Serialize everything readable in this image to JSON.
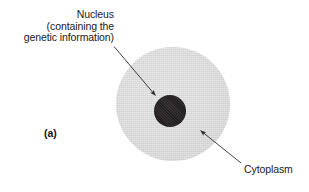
{
  "figure": {
    "panel_letter": "(a)",
    "diagram_type": "animal-cell-schematic",
    "colors": {
      "cytoplasm_fill": "#dedede",
      "nucleus_fill": "#231f20",
      "leader_line": "#2b2b2b",
      "background": "#ffffff",
      "text": "#1a1a1a"
    },
    "labels": {
      "nucleus": {
        "line1": "Nucleus",
        "line2": "(containing the",
        "line3": "genetic information)"
      },
      "cytoplasm": "Cytoplasm"
    },
    "parts": [
      {
        "name": "nucleus",
        "label": "Nucleus (containing the genetic information)",
        "shape": "circle",
        "center": [
          170,
          111
        ],
        "diameter_px": 32,
        "fill": "#231f20"
      },
      {
        "name": "cytoplasm",
        "label": "Cytoplasm",
        "shape": "circle",
        "center": [
          173,
          104
        ],
        "diameter_px": 114,
        "fill": "#dedede"
      }
    ],
    "leaders": [
      {
        "name": "nucleus-leader",
        "from": [
          114,
          47
        ],
        "to": [
          157,
          97
        ],
        "arrowhead": "end"
      },
      {
        "name": "cytoplasm-leader",
        "from": [
          241,
          163
        ],
        "to": [
          199,
          129
        ],
        "arrowhead": "end"
      }
    ]
  }
}
